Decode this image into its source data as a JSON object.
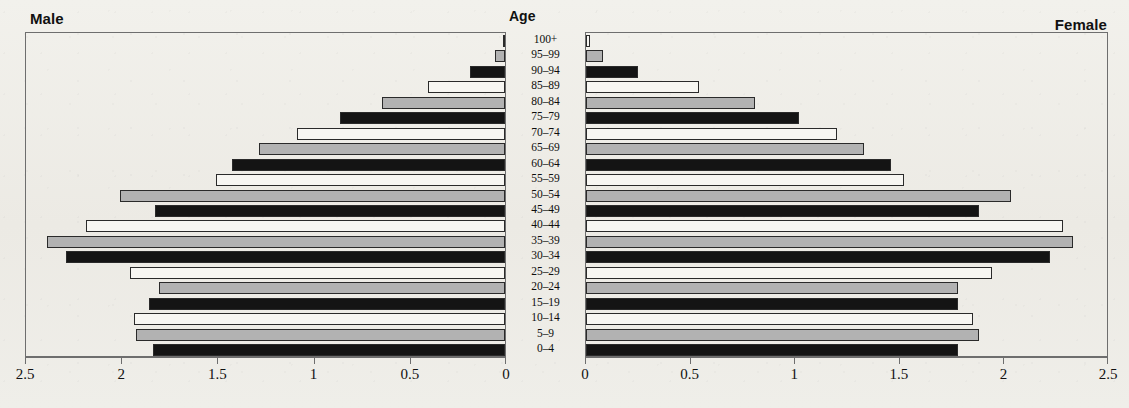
{
  "titles": {
    "male": "Male",
    "female": "Female",
    "age": "Age"
  },
  "axis": {
    "left_ticks": [
      "2.5",
      "2",
      "1.5",
      "1",
      "0.5",
      "0"
    ],
    "right_ticks": [
      "0",
      "0.5",
      "1",
      "1.5",
      "2",
      "2.5"
    ],
    "max": 2.5,
    "min": 0
  },
  "colors": {
    "white": "#f7f6f2",
    "gray": "#b2b2b2",
    "black": "#141414",
    "frame": "#6e6e6e",
    "background": "#efefea"
  },
  "chart_data": {
    "type": "bar",
    "xlabel": "",
    "ylabel": "Age",
    "xlim": [
      0,
      2.5
    ],
    "grid": false,
    "legend": "none",
    "categories": [
      "100+",
      "95-99",
      "90-94",
      "85-89",
      "80-84",
      "75-79",
      "70-74",
      "65-69",
      "60-64",
      "55-59",
      "50-54",
      "45-49",
      "40-44",
      "35-39",
      "30-34",
      "25-29",
      "20-24",
      "15-19",
      "10-14",
      "5-9",
      "0-4"
    ],
    "fills": [
      "white",
      "gray",
      "black",
      "white",
      "gray",
      "black",
      "white",
      "gray",
      "black",
      "white",
      "gray",
      "black",
      "white",
      "gray",
      "black",
      "white",
      "gray",
      "black",
      "white",
      "gray",
      "black"
    ],
    "series": [
      {
        "name": "Male",
        "side": "left",
        "values": [
          0.01,
          0.05,
          0.18,
          0.4,
          0.64,
          0.86,
          1.08,
          1.28,
          1.42,
          1.5,
          2.0,
          1.82,
          2.18,
          2.38,
          2.28,
          1.95,
          1.8,
          1.85,
          1.93,
          1.92,
          1.83
        ]
      },
      {
        "name": "Female",
        "side": "right",
        "values": [
          0.02,
          0.08,
          0.25,
          0.54,
          0.81,
          1.02,
          1.2,
          1.33,
          1.46,
          1.52,
          2.03,
          1.88,
          2.28,
          2.33,
          2.22,
          1.94,
          1.78,
          1.78,
          1.85,
          1.88,
          1.78
        ]
      }
    ]
  }
}
